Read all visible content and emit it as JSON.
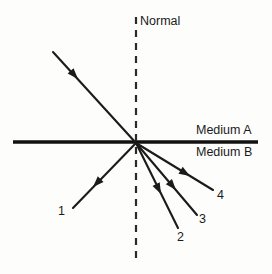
{
  "diagram": {
    "title_label": "Normal",
    "medium_upper_label": "Medium A",
    "medium_lower_label": "Medium B",
    "ray_labels": [
      {
        "id": "1",
        "text": "1"
      },
      {
        "id": "2",
        "text": "2"
      },
      {
        "id": "3",
        "text": "3"
      },
      {
        "id": "4",
        "text": "4"
      }
    ],
    "colors": {
      "background": "#fdfdfc",
      "ink": "#1b1b1b",
      "interface_line": "#111111",
      "normal_line": "#2a2a2a",
      "ray_line": "#1b1b1b"
    },
    "geometry": {
      "canvas_width": 272,
      "canvas_height": 274,
      "incidence_point": {
        "x": 136,
        "y": 143
      },
      "interface_line": {
        "x1": 13,
        "y1": 142,
        "x2": 258,
        "y2": 142,
        "stroke_width": 3.4
      },
      "normal_line": {
        "x": 136,
        "y1": 17,
        "y2": 260,
        "stroke_width": 2.2,
        "dash": "7 6"
      },
      "incident_ray": {
        "name": "incident-ray",
        "x1": 53,
        "y1": 52,
        "x2": 136,
        "y2": 143,
        "arrow_x": 78,
        "arrow_y": 79,
        "arrow_angle": 47.6
      },
      "rays": [
        {
          "name": "ray-1",
          "label": "1",
          "x1": 136,
          "y1": 143,
          "x2": 73,
          "y2": 208,
          "arrow_x": 93,
          "arrow_y": 187,
          "arrow_angle": 134.1
        },
        {
          "name": "ray-2",
          "label": "2",
          "x1": 136,
          "y1": 143,
          "x2": 178,
          "y2": 228,
          "arrow_x": 161,
          "arrow_y": 194,
          "arrow_angle": 63.7
        },
        {
          "name": "ray-3",
          "label": "3",
          "x1": 136,
          "y1": 143,
          "x2": 197,
          "y2": 215,
          "arrow_x": 176,
          "arrow_y": 190,
          "arrow_angle": 49.7
        },
        {
          "name": "ray-4",
          "label": "4",
          "x1": 136,
          "y1": 143,
          "x2": 213,
          "y2": 190,
          "arrow_x": 190,
          "arrow_y": 176,
          "arrow_angle": 31.4
        }
      ],
      "ray_stroke_width": 2.1
    }
  }
}
